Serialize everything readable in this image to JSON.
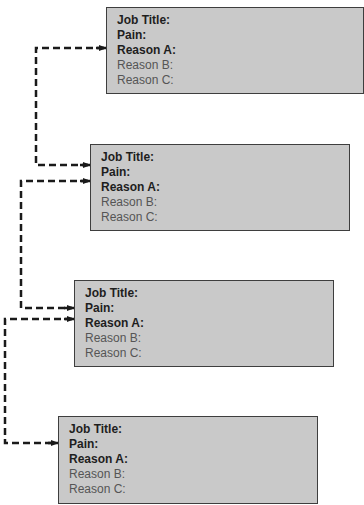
{
  "cards": [
    {
      "fields": [
        "Job Title:",
        "Pain:",
        "Reason A:",
        "Reason B:",
        "Reason C:"
      ]
    },
    {
      "fields": [
        "Job Title:",
        "Pain:",
        "Reason A:",
        "Reason B:",
        "Reason C:"
      ]
    },
    {
      "fields": [
        "Job Title:",
        "Pain:",
        "Reason A:",
        "Reason B:",
        "Reason C:"
      ]
    },
    {
      "fields": [
        "Job Title:",
        "Pain:",
        "Reason A:",
        "Reason B:",
        "Reason C:"
      ]
    }
  ],
  "colors": {
    "card_fill": "#c9c9c9",
    "card_border": "#3e3e3e",
    "bold_text": "#1e1e1e",
    "regular_text": "#555555",
    "connector": "#1a1a1a"
  }
}
